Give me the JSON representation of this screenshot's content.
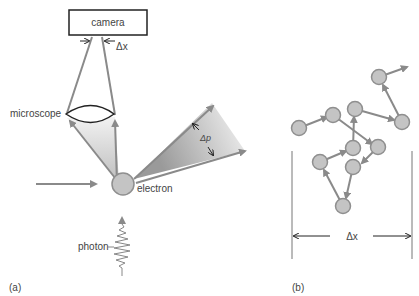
{
  "panel_a": {
    "label": "(a)",
    "camera_label": "camera",
    "delta_x_label": "Δx",
    "microscope_label": "microscope",
    "delta_p_label": "Δp",
    "electron_label": "electron",
    "photon_label": "photon"
  },
  "panel_b": {
    "label": "(b)",
    "delta_x_label": "Δx"
  },
  "colors": {
    "arrow": "#8a8a8a",
    "particle_fill": "#c4c4c4",
    "particle_stroke": "#8f8f8f",
    "text": "#444444"
  }
}
